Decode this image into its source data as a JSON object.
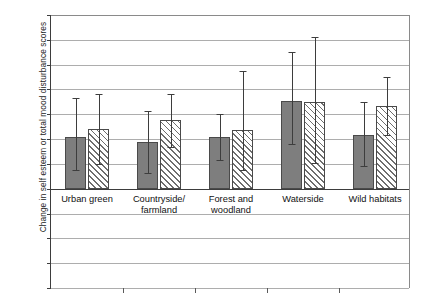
{
  "chart_data": {
    "type": "bar",
    "title": "",
    "xlabel": "",
    "ylabel": "Change in self esteem or total mood disturbance scores",
    "ylim": [
      -0.8,
      1.4
    ],
    "ytick_step": 0.2,
    "yticks": [
      "1.4",
      "1.2",
      "1",
      "0.8",
      "0.6",
      "0.4",
      "0.2",
      "0",
      "-0.2",
      "-0.4",
      "-0.6",
      "-0.8"
    ],
    "ytick_values": [
      1.4,
      1.2,
      1.0,
      0.8,
      0.6,
      0.4,
      0.2,
      0,
      -0.2,
      -0.4,
      -0.6,
      -0.8
    ],
    "grid": true,
    "legend": "none",
    "categories": [
      {
        "line1": "Urban green",
        "line2": ""
      },
      {
        "line1": "Countryside/",
        "line2": "farmland"
      },
      {
        "line1": "Forest and",
        "line2": "woodland"
      },
      {
        "line1": "Waterside",
        "line2": ""
      },
      {
        "line1": "Wild habitats",
        "line2": ""
      }
    ],
    "category_labels": [
      "Urban green",
      "Countryside/ farmland",
      "Forest and woodland",
      "Waterside",
      "Wild habitats"
    ],
    "series": [
      {
        "name": "self esteem",
        "fill": "solid-grey",
        "color": "#7e7e7e",
        "values": [
          0.42,
          0.38,
          0.42,
          0.71,
          0.43
        ],
        "error_upper": [
          0.73,
          0.63,
          0.6,
          1.1,
          0.7
        ],
        "error_lower": [
          0.15,
          0.13,
          0.23,
          0.36,
          0.18
        ]
      },
      {
        "name": "total mood disturbance",
        "fill": "hatched",
        "color": "#ffffff",
        "values": [
          0.48,
          0.55,
          0.47,
          0.7,
          0.67
        ],
        "error_upper": [
          0.76,
          0.76,
          0.95,
          1.22,
          0.9
        ],
        "error_lower": [
          0.2,
          0.34,
          0.15,
          0.21,
          0.43
        ]
      }
    ]
  },
  "axis": {
    "y_title": "Change in self esteem or total mood disturbance scores"
  }
}
